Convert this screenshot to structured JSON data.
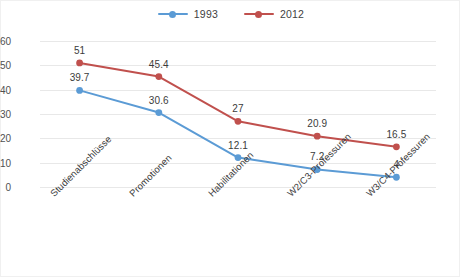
{
  "chart_data": {
    "type": "line",
    "title": "",
    "subtitle": "",
    "xlabel": "",
    "ylabel": "",
    "ylim": [
      0,
      60
    ],
    "ytick_step": 10,
    "yticks": [
      "60",
      "50",
      "40",
      "30",
      "20",
      "10",
      "0"
    ],
    "grid": true,
    "legend_position": "top-center",
    "categories": [
      "Studienabschlüsse",
      "Promotionen",
      "Habilitationen",
      "W2/C3-Professuren",
      "W3/C4-Professuren"
    ],
    "series": [
      {
        "name": "1993",
        "color": "#5B9BD5",
        "values": [
          39.7,
          30.6,
          12.1,
          7.2,
          4
        ],
        "labels": [
          "39.7",
          "30.6",
          "12.1",
          "7.2",
          "4"
        ]
      },
      {
        "name": "2012",
        "color": "#C0504D",
        "values": [
          51,
          45.4,
          27,
          20.9,
          16.5
        ],
        "labels": [
          "51",
          "45.4",
          "27",
          "20.9",
          "16.5"
        ]
      }
    ]
  },
  "legend": {
    "items": [
      {
        "label": "1993",
        "color": "#5B9BD5",
        "marker": "line-with-dot-marker"
      },
      {
        "label": "2012",
        "color": "#C0504D",
        "marker": "line-with-dot-marker"
      }
    ]
  },
  "colors": {
    "series_1993": "#5B9BD5",
    "series_2012": "#C0504D",
    "gridline": "#E8E8E8",
    "text": "#3F3F3F",
    "background": "#FFFFFF"
  }
}
